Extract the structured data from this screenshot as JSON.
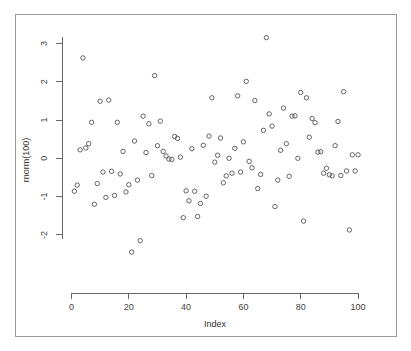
{
  "window": {
    "background_color": "#ffffff",
    "border_color": "#999999"
  },
  "chart_data": {
    "type": "scatter",
    "title": "",
    "xlabel": "Index",
    "ylabel": "rnorm(100)",
    "xlim": [
      0,
      101
    ],
    "ylim": [
      -2.55,
      3.2
    ],
    "grid": false,
    "legend": null,
    "point_symbol": "open-circle",
    "point_color": "#555555",
    "xticks": [
      0,
      20,
      40,
      60,
      80,
      100
    ],
    "xtick_labels": [
      "0",
      "20",
      "40",
      "60",
      "80",
      "100"
    ],
    "yticks": [
      -2,
      -1,
      0,
      1,
      2,
      3
    ],
    "ytick_labels": [
      "-2",
      "-1",
      "0",
      "1",
      "2",
      "3"
    ],
    "x": [
      1,
      2,
      3,
      4,
      5,
      6,
      7,
      8,
      9,
      10,
      11,
      12,
      13,
      14,
      15,
      16,
      17,
      18,
      19,
      20,
      21,
      22,
      23,
      24,
      25,
      26,
      27,
      28,
      29,
      30,
      31,
      32,
      33,
      34,
      35,
      36,
      37,
      38,
      39,
      40,
      41,
      42,
      43,
      44,
      45,
      46,
      47,
      48,
      49,
      50,
      51,
      52,
      53,
      54,
      55,
      56,
      57,
      58,
      59,
      60,
      61,
      62,
      63,
      64,
      65,
      66,
      67,
      68,
      69,
      70,
      71,
      72,
      73,
      74,
      75,
      76,
      77,
      78,
      79,
      80,
      81,
      82,
      83,
      84,
      85,
      86,
      87,
      88,
      89,
      90,
      91,
      92,
      93,
      94,
      95,
      96,
      97,
      98,
      99,
      100
    ],
    "y": [
      -0.86,
      -0.7,
      0.22,
      2.62,
      0.27,
      0.38,
      0.94,
      -1.2,
      -0.66,
      1.49,
      -0.36,
      -1.02,
      1.52,
      -0.34,
      -0.97,
      0.94,
      -0.41,
      0.18,
      -0.88,
      -0.69,
      -2.45,
      0.45,
      -0.57,
      -2.15,
      1.1,
      0.15,
      0.9,
      -0.45,
      2.16,
      0.33,
      0.97,
      0.18,
      0.06,
      -0.02,
      -0.03,
      0.57,
      0.52,
      0.03,
      -1.55,
      -0.85,
      -1.11,
      0.25,
      -0.86,
      -1.52,
      -1.18,
      0.34,
      -0.99,
      0.58,
      1.58,
      -0.1,
      0.08,
      0.53,
      -0.64,
      -0.46,
      0.0,
      -0.39,
      0.26,
      1.63,
      -0.36,
      0.43,
      2.01,
      -0.08,
      -0.25,
      1.51,
      -0.79,
      -0.42,
      0.73,
      3.15,
      1.16,
      0.84,
      -1.26,
      -0.57,
      0.21,
      1.31,
      0.38,
      -0.47,
      1.1,
      1.11,
      0.0,
      1.72,
      -1.64,
      1.58,
      0.55,
      1.04,
      0.93,
      0.16,
      0.17,
      -0.39,
      -0.26,
      -0.43,
      -0.46,
      0.33,
      0.96,
      -0.45,
      1.74,
      -0.33,
      -1.87,
      0.09,
      -0.33,
      0.09
    ]
  }
}
